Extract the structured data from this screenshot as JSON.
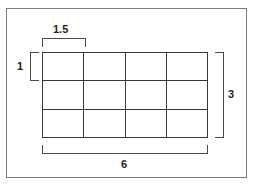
{
  "figure": {
    "type": "geometry-dimension-diagram",
    "frame": {
      "border_color": "#7a7a7a"
    },
    "grid": {
      "columns": 4,
      "rows": 3,
      "line_color": "#3a3a3a",
      "cells": [
        {
          "row": 1,
          "col": 1
        },
        {
          "row": 1,
          "col": 2
        },
        {
          "row": 1,
          "col": 3
        },
        {
          "row": 1,
          "col": 4
        },
        {
          "row": 2,
          "col": 1
        },
        {
          "row": 2,
          "col": 2
        },
        {
          "row": 2,
          "col": 3
        },
        {
          "row": 2,
          "col": 4
        },
        {
          "row": 3,
          "col": 1
        },
        {
          "row": 3,
          "col": 2
        },
        {
          "row": 3,
          "col": 3
        },
        {
          "row": 3,
          "col": 4
        }
      ]
    },
    "dimensions": [
      {
        "id": "cell-width",
        "value": "1.5",
        "position": "top",
        "spans": "one column",
        "bracket_color": "#4a4a4a"
      },
      {
        "id": "cell-height",
        "value": "1",
        "position": "left",
        "spans": "one row",
        "bracket_color": "#4a4a4a"
      },
      {
        "id": "total-height",
        "value": "3",
        "position": "right",
        "spans": "all rows",
        "bracket_color": "#4a4a4a"
      },
      {
        "id": "total-width",
        "value": "6",
        "position": "bottom",
        "spans": "all columns",
        "bracket_color": "#4a4a4a"
      }
    ]
  }
}
